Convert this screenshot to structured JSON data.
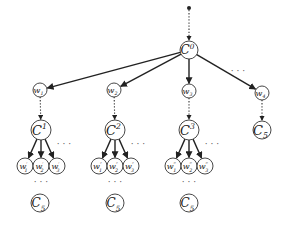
{
  "diagram": {
    "type": "tree",
    "root_dot": {
      "x": 189,
      "y": 8
    },
    "root": {
      "id": "C0",
      "label": "C",
      "sup": "0",
      "x": 189,
      "y": 50,
      "r": 9
    },
    "level1": [
      {
        "id": "w1",
        "label": "w",
        "sub": "1",
        "x": 40,
        "y": 90,
        "r": 7
      },
      {
        "id": "w2",
        "label": "w",
        "sub": "2",
        "x": 114,
        "y": 90,
        "r": 7
      },
      {
        "id": "w3",
        "label": "w",
        "sub": "3",
        "x": 189,
        "y": 91,
        "r": 7
      },
      {
        "id": "w4",
        "label": "w",
        "sub": "4",
        "x": 262,
        "y": 93,
        "r": 7
      }
    ],
    "level1_ellipsis": {
      "text": "· · ·",
      "x": 238,
      "y": 74
    },
    "level2": [
      {
        "id": "C1",
        "label": "C",
        "sup": "1",
        "x": 41,
        "y": 130,
        "r": 10
      },
      {
        "id": "C2",
        "label": "C",
        "sup": "2",
        "x": 115,
        "y": 130,
        "r": 10
      },
      {
        "id": "C3",
        "label": "C",
        "sup": "3",
        "x": 189,
        "y": 130,
        "r": 10
      },
      {
        "id": "C5_right",
        "label": "C",
        "sub": "5",
        "x": 262,
        "y": 130,
        "r": 9
      }
    ],
    "leaf_groups": [
      {
        "parent": "C1",
        "ellipsis": {
          "text": "· · ·",
          "x": 64,
          "y": 147
        },
        "leaves": [
          {
            "label": "w",
            "prime": "′",
            "sub": "1",
            "x": 25,
            "y": 166,
            "r": 8
          },
          {
            "label": "w",
            "prime": "′",
            "sub": "2",
            "x": 41,
            "y": 166,
            "r": 8
          },
          {
            "label": "w",
            "prime": "′",
            "sub": "3",
            "x": 57,
            "y": 166,
            "r": 8
          }
        ],
        "below_ellipsis": {
          "text": "· · ·",
          "x": 41,
          "y": 185
        },
        "bottom": {
          "label": "C",
          "sub": "5",
          "x": 40,
          "y": 203,
          "r": 9
        }
      },
      {
        "parent": "C2",
        "ellipsis": {
          "text": "· · ·",
          "x": 138,
          "y": 147
        },
        "leaves": [
          {
            "label": "w",
            "prime": "″",
            "sub": "1",
            "x": 99,
            "y": 166,
            "r": 8
          },
          {
            "label": "w",
            "prime": "″",
            "sub": "2",
            "x": 115,
            "y": 166,
            "r": 8
          },
          {
            "label": "w",
            "prime": "″",
            "sub": "3",
            "x": 131,
            "y": 166,
            "r": 8
          }
        ],
        "below_ellipsis": {
          "text": "· · ·",
          "x": 115,
          "y": 185
        },
        "bottom": {
          "label": "C",
          "sub": "5",
          "x": 115,
          "y": 203,
          "r": 9
        }
      },
      {
        "parent": "C3",
        "ellipsis": {
          "text": "· · ·",
          "x": 212,
          "y": 147
        },
        "leaves": [
          {
            "label": "w",
            "prime": "‴",
            "sub": "1",
            "x": 173,
            "y": 166,
            "r": 8
          },
          {
            "label": "w",
            "prime": "‴",
            "sub": "2",
            "x": 189,
            "y": 166,
            "r": 8
          },
          {
            "label": "w",
            "prime": "‴",
            "sub": "3",
            "x": 205,
            "y": 166,
            "r": 8
          }
        ],
        "below_ellipsis": {
          "text": "· · ·",
          "x": 189,
          "y": 185
        },
        "bottom": {
          "label": "C",
          "sub": "5",
          "x": 189,
          "y": 203,
          "r": 9
        }
      }
    ]
  }
}
